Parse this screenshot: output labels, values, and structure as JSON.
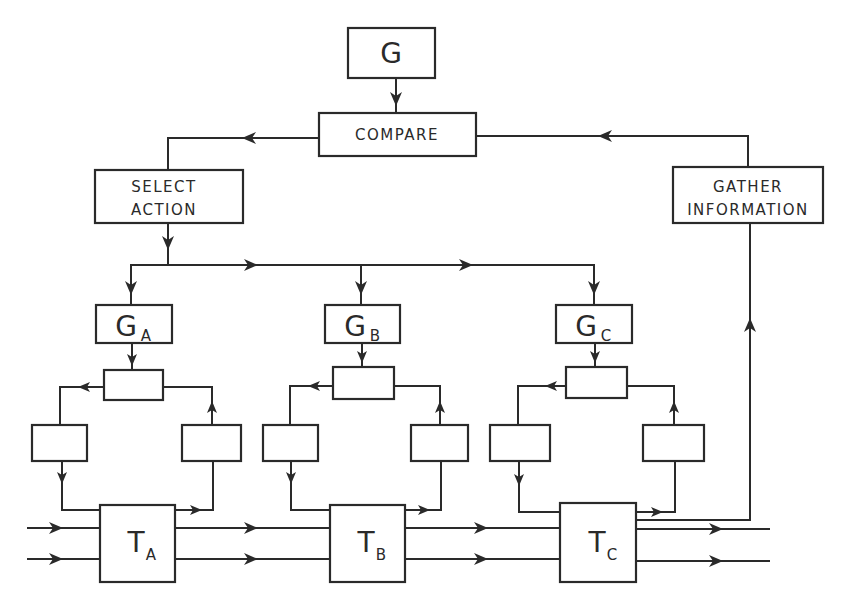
{
  "diagram": {
    "goal": {
      "label": "G"
    },
    "compare": {
      "label": "COMPARE"
    },
    "select_action": {
      "line1": "SELECT",
      "line2": "ACTION"
    },
    "gather_information": {
      "line1": "GATHER",
      "line2": "INFORMATION"
    },
    "subsystems": [
      {
        "goal_main": "G",
        "goal_sub": "A",
        "task_main": "T",
        "task_sub": "A"
      },
      {
        "goal_main": "G",
        "goal_sub": "B",
        "task_main": "T",
        "task_sub": "B"
      },
      {
        "goal_main": "G",
        "goal_sub": "C",
        "task_main": "T",
        "task_sub": "C"
      }
    ]
  },
  "colors": {
    "stroke": "#2a2a2a",
    "background": "#ffffff"
  }
}
